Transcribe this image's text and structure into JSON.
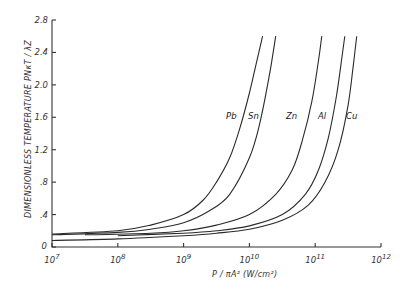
{
  "chart_data": {
    "type": "line",
    "title": "",
    "xlabel": "P / πA² (W/cm²)",
    "ylabel": "DIMENSIONLESS TEMPERATURE PNκT / λZ",
    "xscale": "log",
    "xlim": [
      10000000.0,
      1000000000000.0
    ],
    "ylim": [
      0,
      2.8
    ],
    "x_ticks": [
      "10^7",
      "10^8",
      "10^9",
      "10^10",
      "10^11",
      "10^12"
    ],
    "y_ticks": [
      "0",
      "0.4",
      "0.8",
      "1.2",
      "1.6",
      "2.0",
      "2.4",
      "2.8"
    ],
    "grid": false,
    "legend": "inline labels near curve tops",
    "series": [
      {
        "name": "Pb",
        "log10_x": [
          7.0,
          8.0,
          8.5,
          9.0,
          9.3,
          9.5,
          9.7,
          9.85,
          10.0,
          10.1,
          10.2
        ],
        "y": [
          0.16,
          0.2,
          0.27,
          0.4,
          0.58,
          0.8,
          1.1,
          1.45,
          1.9,
          2.25,
          2.6
        ]
      },
      {
        "name": "Sn",
        "log10_x": [
          7.0,
          8.0,
          8.5,
          9.0,
          9.4,
          9.7,
          10.0,
          10.15,
          10.3,
          10.4
        ],
        "y": [
          0.15,
          0.18,
          0.22,
          0.3,
          0.45,
          0.65,
          1.1,
          1.5,
          2.1,
          2.6
        ]
      },
      {
        "name": "Zn",
        "log10_x": [
          7.5,
          8.5,
          9.0,
          9.5,
          10.0,
          10.4,
          10.65,
          10.8,
          10.95,
          11.05,
          11.1
        ],
        "y": [
          0.15,
          0.17,
          0.2,
          0.27,
          0.4,
          0.65,
          0.95,
          1.3,
          1.8,
          2.3,
          2.6
        ]
      },
      {
        "name": "Al",
        "log10_x": [
          8.0,
          9.0,
          9.5,
          10.0,
          10.5,
          10.85,
          11.05,
          11.2,
          11.32,
          11.4,
          11.45
        ],
        "y": [
          0.14,
          0.17,
          0.2,
          0.26,
          0.4,
          0.65,
          0.95,
          1.35,
          1.85,
          2.3,
          2.6
        ]
      },
      {
        "name": "Cu",
        "log10_x": [
          7.0,
          8.0,
          9.0,
          9.5,
          10.0,
          10.5,
          10.9,
          11.15,
          11.35,
          11.5,
          11.58,
          11.63
        ],
        "y": [
          0.08,
          0.1,
          0.14,
          0.17,
          0.22,
          0.33,
          0.52,
          0.8,
          1.2,
          1.75,
          2.25,
          2.6
        ]
      }
    ]
  },
  "axes": {
    "x_title": "P / πA²  (W/cm²)",
    "y_title": "DIMENSIONLESS  TEMPERATURE  PNκT / λZ"
  }
}
